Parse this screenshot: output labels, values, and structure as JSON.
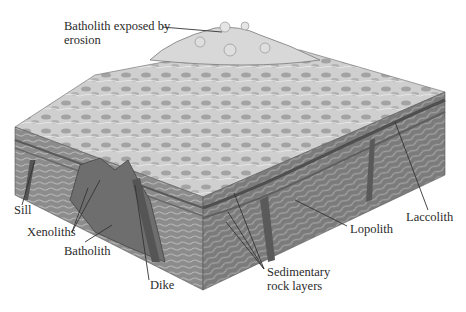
{
  "figure": {
    "type": "block-diagram"
  },
  "labels": {
    "batholith_exposed_line1": "Batholith exposed by",
    "batholith_exposed_line2": "erosion",
    "sill": "Sill",
    "xenoliths": "Xenoliths",
    "batholith": "Batholith",
    "dike": "Dike",
    "sedimentary_line1": "Sedimentary",
    "sedimentary_line2": "rock layers",
    "lopolith": "Lopolith",
    "laccolith": "Laccolith"
  },
  "colors": {
    "surface": "#c9c9c9",
    "surface_dark": "#9a9a9a",
    "front_face": "#8f8f8f",
    "side_face": "#7d7d7d",
    "batholith": "#6e6e6e",
    "leader": "#333333",
    "text": "#2b2b2b"
  }
}
